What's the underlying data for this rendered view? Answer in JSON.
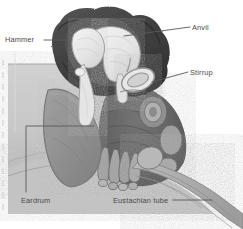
{
  "figure": {
    "width": 243,
    "height": 229,
    "background": "#ffffff"
  },
  "labels": {
    "hammer": "Hammer",
    "anvil": "Anvil",
    "stirrup": "Stirrup",
    "eardrum": "Eardrum",
    "eustachian_tube": "Eustachian tube"
  },
  "palette": {
    "background": "#ffffff",
    "text": "#4a4a4a",
    "leader_line": "#5a5a5a",
    "tissue_light": "#c8c8c8",
    "tissue_mid": "#a6a6a6",
    "eardrum_gray": "#8a8a8a",
    "cavity_dark": "#3c3c3c",
    "cavity_darker": "#2b2b2b",
    "bone_white": "#ececec",
    "bone_shadow": "#b9b9b9",
    "outline": "#6e6e6e"
  },
  "structures": [
    {
      "name": "hammer",
      "common_name": "Hammer",
      "anatomical_name": "Malleus",
      "fill": "#ececec"
    },
    {
      "name": "anvil",
      "common_name": "Anvil",
      "anatomical_name": "Incus",
      "fill": "#ececec"
    },
    {
      "name": "stirrup",
      "common_name": "Stirrup",
      "anatomical_name": "Stapes",
      "fill": "#ececec"
    },
    {
      "name": "eardrum",
      "common_name": "Eardrum",
      "anatomical_name": "Tympanic membrane",
      "fill": "#8a8a8a"
    },
    {
      "name": "eustachian-tube",
      "common_name": "Eustachian tube",
      "anatomical_name": "Auditory tube",
      "fill": "#b0b0b0"
    }
  ]
}
